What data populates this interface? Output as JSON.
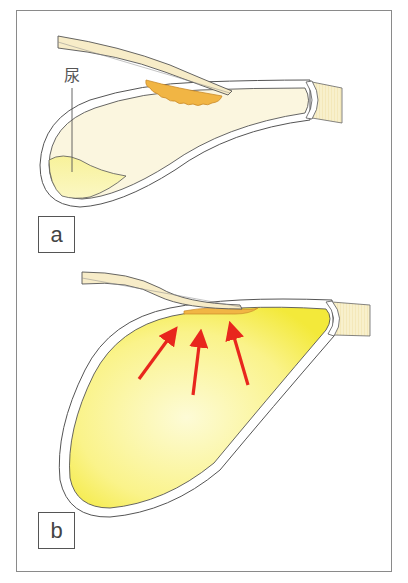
{
  "figure": {
    "panels": [
      {
        "id": "a",
        "label": "a",
        "state": "bladder with small urine volume; catheter tip region with orange lesion on upper wall"
      },
      {
        "id": "b",
        "label": "b",
        "state": "distended bladder filled with urine; arrows show pressure toward upper wall"
      }
    ],
    "annotations": {
      "urine_label": "尿"
    },
    "colors": {
      "frame": "#8a8a8a",
      "outline": "#555555",
      "wall_fill": "#ffffff",
      "lumen_fill": "#fbf6df",
      "urine_fill": "#f6f07a",
      "urine_fill_light": "#fdfbd0",
      "lesion_fill": "#f1b544",
      "tube_fill": "#f7ecc8",
      "urethra_fill": "#f8f0cc",
      "arrow": "#e8261d"
    },
    "arrows_b": [
      {
        "x1": 139,
        "y1": 379,
        "x2": 176,
        "y2": 329
      },
      {
        "x1": 193,
        "y1": 395,
        "x2": 201,
        "y2": 333
      },
      {
        "x1": 248,
        "y1": 385,
        "x2": 230,
        "y2": 325
      }
    ]
  }
}
